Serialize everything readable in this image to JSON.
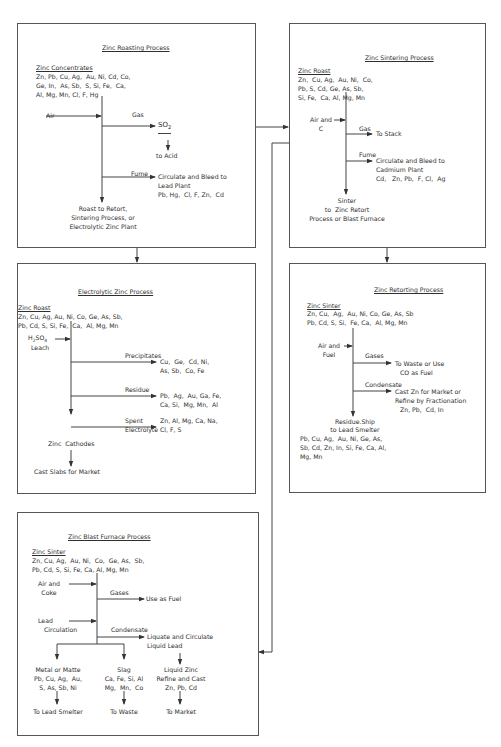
{
  "roasting": {
    "title": "Zinc Roasting Process",
    "feed_name": "Zinc Concentrates",
    "feed_elements": [
      "Zn, Pb, Cu, Ag,  Au, Ni, Cd, Co,",
      "Ge, In,  As, Sb,  S, Si, Fe,  Ca,",
      "Al, Mg, Mn, Cl, F, Hg"
    ],
    "input": "Air",
    "gas_label": "Gas",
    "gas_product": "SO",
    "gas_product_sub": "2",
    "gas_dest": "to Acid",
    "fume_label": "Fume",
    "fume_dest": [
      "Circulate and Bleed to",
      "Lead Plant",
      "Pb, Hg,  Cl, F, Zn,  Cd"
    ],
    "output": [
      "Roast to Retort,",
      "Sintering Process, or",
      "Electrolytic Zinc Plant"
    ]
  },
  "sintering": {
    "title": "Zinc Sintering Process",
    "feed_name": "Zinc Roast",
    "feed_elements": [
      "Zn,  Cu, Ag,  Au, Ni,  Co,",
      "Pb, S, Cd, Ge, As, Sb,",
      "Si, Fe,  Ca, Al, Mg, Mn"
    ],
    "input": [
      "Air and",
      "C"
    ],
    "gas_label": "Gas",
    "gas_dest": "To Stack",
    "fume_label": "Fume",
    "fume_dest": [
      "Circulate and Bleed to",
      "Cadmium Plant",
      "Cd,   Zn, Pb,  F, Cl,  Ag"
    ],
    "output": [
      "Sinter",
      "to  Zinc Retort",
      "Process or Blast Furnace"
    ]
  },
  "electrolytic": {
    "title": "Electrolytic Zinc Process",
    "feed_name": "Zinc Roast",
    "feed_elements": [
      "Zn, Cu, Ag, Au, Ni, Co, Ge, As, Sb,",
      "Pb, Cd, S, Si, Fe,  Ca,  Al, Mg, Mn"
    ],
    "input_formula": "H",
    "input_sub1": "2",
    "input_formula2": "SO",
    "input_sub2": "4",
    "input_line2": "Leach",
    "precip_label": "Precipitates",
    "precip_dest": [
      "Cu,  Ge,  Cd, Ni,",
      "As, Sb,  Co, Fe"
    ],
    "residue_label": "Residue",
    "residue_dest": [
      "Pb,  Ag,  Au, Ga, Fe,",
      "Ca, Si,  Mg, Mn,  Al"
    ],
    "spent_label": [
      "Spent",
      "Electrolyte"
    ],
    "spent_dest": [
      "Zn, Al, Mg, Ca, Na,",
      "Cl, F, S"
    ],
    "cathodes": "Zinc  Cathodes",
    "output": "Cast Slabs for Market"
  },
  "retorting": {
    "title": "Zinc Retorting Process",
    "feed_name": "Zinc Sinter",
    "feed_elements": [
      "Zn, Cu,  Ag,  Au, Ni, Co, Ge, As, Sb",
      "Pb, Cd, S, Si,  Fe, Ca,  Al, Mg, Mn"
    ],
    "input": [
      "Air and",
      "Fuel"
    ],
    "gases_label": "Gases",
    "gases_dest": [
      "To Waste or Use",
      "CO as Fuel"
    ],
    "condensate_label": "Condensate",
    "condensate_dest": [
      "Cast Zn for Market or",
      "Refine by Fractionation",
      "Zn, Pb,  Cd, In"
    ],
    "residue": [
      "Residue.Ship",
      "to Lead Smelter"
    ],
    "residue_elements": [
      "Pb, Cu, Ag,  Au, Ni, Ge, As,",
      "Sb, Cd, Zn, In, Si, Fe, Ca, Al,",
      "Mg, Mn"
    ]
  },
  "blast": {
    "title": "Zinc Blast Furnace Process",
    "feed_name": "Zinc Sinter",
    "feed_elements": [
      "Zn, Cu, Ag,  Au, Ni,  Co,  Ge, As,  Sb,",
      "Pb, Cd, S, Si, Fe, Ca, Al, Mg, Mn"
    ],
    "input1": [
      "Air and",
      "Coke"
    ],
    "gases_label": "Gases",
    "gases_dest": "Use as Fuel",
    "input2": [
      "Lead",
      "Circulation"
    ],
    "condensate_label": "Condensate",
    "condensate_dest": [
      "Liquate and Circulate",
      "Liquid Lead"
    ],
    "branches": [
      {
        "label": [
          "Metal or Matte",
          "Pb, Cu, Ag,  Au,",
          "S, As, Sb, Ni"
        ],
        "dest": "To Lead Smelter"
      },
      {
        "label": [
          "Slag",
          "Ca, Fe, Si, Al",
          "Mg,  Mn,  Co"
        ],
        "dest": "To Waste"
      },
      {
        "label": [
          "Liquid Zinc",
          "Refine and Cast",
          "Zn, Pb, Cd"
        ],
        "dest": "To Market"
      }
    ]
  }
}
